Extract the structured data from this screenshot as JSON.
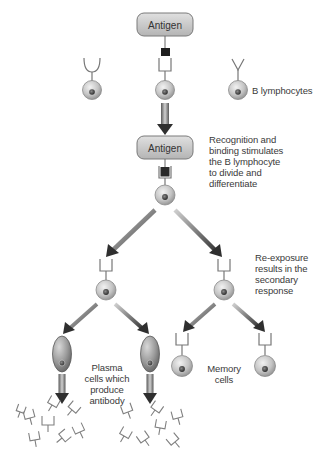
{
  "diagram": {
    "antigen_top": {
      "label": "Antigen"
    },
    "antigen_mid": {
      "label": "Antigen"
    },
    "labels": {
      "b_lymphocytes": "B lymphocytes",
      "recognition": [
        "Recognition and",
        "binding stimulates",
        "the B lymphocyte",
        "to divide and",
        "differentiate"
      ],
      "reexposure": [
        "Re-exposure",
        "results in the",
        "secondary",
        "response"
      ],
      "plasma": [
        "Plasma",
        "cells which",
        "produce",
        "antibody"
      ],
      "memory": [
        "Memory",
        "cells"
      ]
    },
    "colors": {
      "antigen_box_fill": "#c8c8c8",
      "antigen_box_stroke": "#7a7a7a",
      "cell_fill": "#c0c0c0",
      "cell_stroke": "#8a8a8a",
      "nucleus": "#555555",
      "arrow": "#3a3a3a",
      "receptor": "#777777",
      "antigen_block": "#2a2a2a"
    }
  }
}
